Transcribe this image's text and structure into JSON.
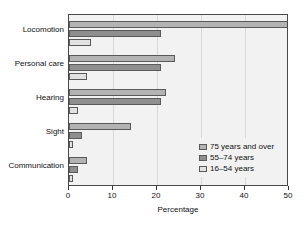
{
  "chart_data": {
    "type": "bar",
    "orientation": "horizontal",
    "title": "",
    "xlabel": "Percentage",
    "ylabel": "",
    "xlim": [
      0,
      50
    ],
    "xticks": [
      0,
      10,
      20,
      30,
      40,
      50
    ],
    "grid": true,
    "legend_position": "center-right",
    "categories": [
      "Locomotion",
      "Personal care",
      "Hearing",
      "Sight",
      "Communication"
    ],
    "series": [
      {
        "name": "75 years and over",
        "color": "#b3b3b3",
        "values": [
          50,
          24,
          22,
          14,
          4
        ]
      },
      {
        "name": "55–74 years",
        "color": "#8f8f8f",
        "values": [
          21,
          21,
          21,
          3,
          2
        ]
      },
      {
        "name": "16–54 years",
        "color": "#e2e2e2",
        "values": [
          5,
          4,
          2,
          1,
          1
        ]
      }
    ]
  },
  "axis": {
    "x_tick_labels": [
      "0",
      "10",
      "20",
      "30",
      "40",
      "50"
    ],
    "x_title": "Percentage"
  },
  "legend": {
    "entries": [
      {
        "label": "75 years and over"
      },
      {
        "label": "55–74 years"
      },
      {
        "label": "16–54 years"
      }
    ]
  }
}
